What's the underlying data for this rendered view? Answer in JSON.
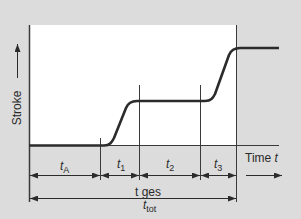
{
  "diagram": {
    "colors": {
      "background": "#dcdcdc",
      "plot_area": "#ffffff",
      "curve": "#2b2b2b",
      "lines": "#3a3a3a",
      "text": "#2a2a2a"
    },
    "y_axis": {
      "label": "Stroke"
    },
    "x_axis": {
      "label_word": "Time",
      "label_var": "t"
    },
    "intervals": [
      {
        "var": "t",
        "sub": "A"
      },
      {
        "var": "t",
        "sub": "1"
      },
      {
        "var": "t",
        "sub": "2"
      },
      {
        "var": "t",
        "sub": "3"
      }
    ],
    "total": {
      "label_de": "t ges",
      "label_var": "t",
      "label_sub": "tot"
    }
  }
}
